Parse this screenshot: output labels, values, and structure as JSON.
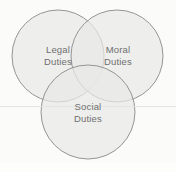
{
  "diagram": {
    "type": "venn",
    "title": "",
    "background_color": "#fbfbfa",
    "stroke_color": "#8a8a8a",
    "fill_color": "#e9e9e7",
    "text_color": "#6e6e6e",
    "hairline_color": "#e4e4e2",
    "sets": [
      {
        "id": "legal",
        "label_line1": "Legal",
        "label_line2": "Duties",
        "cx": 58,
        "cy": 56,
        "r": 46
      },
      {
        "id": "moral",
        "label_line1": "Moral",
        "label_line2": "Duties",
        "cx": 117,
        "cy": 56,
        "r": 46
      },
      {
        "id": "social",
        "label_line1": "Social",
        "label_line2": "Duties",
        "cx": 88,
        "cy": 112,
        "r": 47
      }
    ]
  }
}
